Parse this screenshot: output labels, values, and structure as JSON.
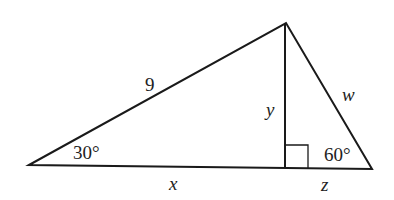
{
  "diagram": {
    "type": "right-triangle-with-altitude",
    "stroke_color": "#1a1a1a",
    "vertices": {
      "left": {
        "x": 29,
        "y": 165
      },
      "top": {
        "x": 286,
        "y": 23
      },
      "right": {
        "x": 372,
        "y": 169
      },
      "foot": {
        "x": 285,
        "y": 168
      }
    },
    "labels": {
      "hypotenuse_left": "9",
      "altitude": "y",
      "right_side": "w",
      "base_left": "x",
      "base_right": "z",
      "angle_left": "30°",
      "angle_right": "60°"
    }
  }
}
